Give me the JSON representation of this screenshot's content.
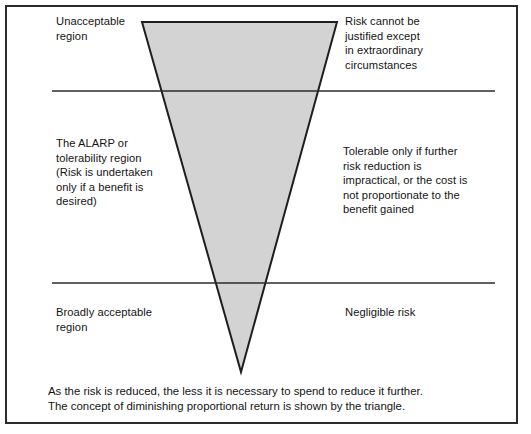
{
  "figure": {
    "name": "ALARP risk triangle",
    "frame": {
      "border_color": "#2b2b2b",
      "background_color": "#ffffff"
    },
    "triangle": {
      "fill_color": "#d3d3d3",
      "stroke_color": "#1e1e1e",
      "apex_position": "bottom",
      "description": "Inverted triangle representing diminishing proportional return"
    },
    "divider_color": "#2b2b2b"
  },
  "regions": [
    {
      "key": "unacceptable",
      "label": "Unacceptable\nregion",
      "description": "Risk cannot be\njustified except\nin extraordinary\ncircumstances"
    },
    {
      "key": "alarp",
      "label": "The ALARP or\ntolerability region\n(Risk is undertaken\nonly if a benefit is\ndesired)",
      "description": "Tolerable only if further\nrisk reduction is\nimpractical, or the cost is\nnot proportionate to the\nbenefit gained"
    },
    {
      "key": "broadly_acceptable",
      "label": "Broadly acceptable\nregion",
      "description": "Negligible risk"
    }
  ],
  "caption": "As the risk is reduced, the less it is necessary to spend to reduce it further.\nThe concept of diminishing proportional return is shown by the triangle."
}
